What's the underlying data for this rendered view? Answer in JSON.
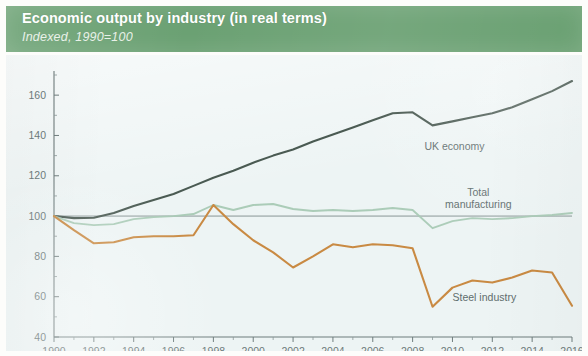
{
  "header": {
    "title": "Economic output by industry (in real terms)",
    "subtitle": "Indexed, 1990=100",
    "band_color": "#6ba173",
    "title_color": "#ffffff"
  },
  "chart_data": {
    "type": "line",
    "title": "Economic output by industry (in real terms)",
    "subtitle": "Indexed, 1990=100",
    "xlabel": "",
    "ylabel": "",
    "xlim": [
      1990,
      2016
    ],
    "ylim": [
      40,
      170
    ],
    "yticks": [
      40,
      60,
      80,
      100,
      120,
      140,
      160
    ],
    "xticks": [
      1990,
      1992,
      1994,
      1996,
      1998,
      2000,
      2002,
      2004,
      2006,
      2008,
      2010,
      2012,
      2014,
      2016
    ],
    "xtick_labels": [
      "1990",
      "1992",
      "1994",
      "1996",
      "1998",
      "2000",
      "2002",
      "2004",
      "2006",
      "2008",
      "2010",
      "2012",
      "2014",
      "2016"
    ],
    "ytick_labels": [
      "40",
      "60",
      "80",
      "100",
      "120",
      "140",
      "160"
    ],
    "grid": false,
    "legend": "inline-labels",
    "reference_line": 100,
    "x": [
      1990,
      1991,
      1992,
      1993,
      1994,
      1995,
      1996,
      1997,
      1998,
      1999,
      2000,
      2001,
      2002,
      2003,
      2004,
      2005,
      2006,
      2007,
      2008,
      2009,
      2010,
      2011,
      2012,
      2013,
      2014,
      2015,
      2016
    ],
    "series": [
      {
        "name": "UK economy",
        "color": "#4a5a52",
        "label_x": 2010.1,
        "label_y": 133,
        "values": [
          100,
          99,
          99.2,
          101.5,
          105,
          108,
          111,
          115,
          119,
          122.5,
          126.5,
          130,
          133,
          137,
          140.5,
          144,
          147.5,
          151,
          151.5,
          145,
          147,
          149,
          151,
          154,
          158,
          162,
          167
        ]
      },
      {
        "name": "Total manufacturing",
        "color": "#a8c9b4",
        "label_x": 2011.3,
        "label_y": 110,
        "label_lines": [
          "Total",
          "manufacturing"
        ],
        "values": [
          100,
          96.5,
          95.5,
          96,
          98.5,
          99.5,
          100,
          101,
          105.5,
          103,
          105.5,
          106,
          103.5,
          102.5,
          103,
          102.5,
          103,
          104,
          103,
          94,
          97.5,
          99,
          98.5,
          99,
          100,
          100.5,
          101.5
        ]
      },
      {
        "name": "Steel industry",
        "color": "#c98a43",
        "label_x": 2011.6,
        "label_y": 58,
        "values": [
          100,
          93,
          86.5,
          87,
          89.5,
          90,
          90,
          90.5,
          105.5,
          96,
          88,
          82,
          74.5,
          80,
          86,
          84.5,
          86,
          85.5,
          84,
          55,
          64.5,
          68,
          67,
          69.5,
          73,
          72,
          55.5
        ]
      }
    ]
  }
}
